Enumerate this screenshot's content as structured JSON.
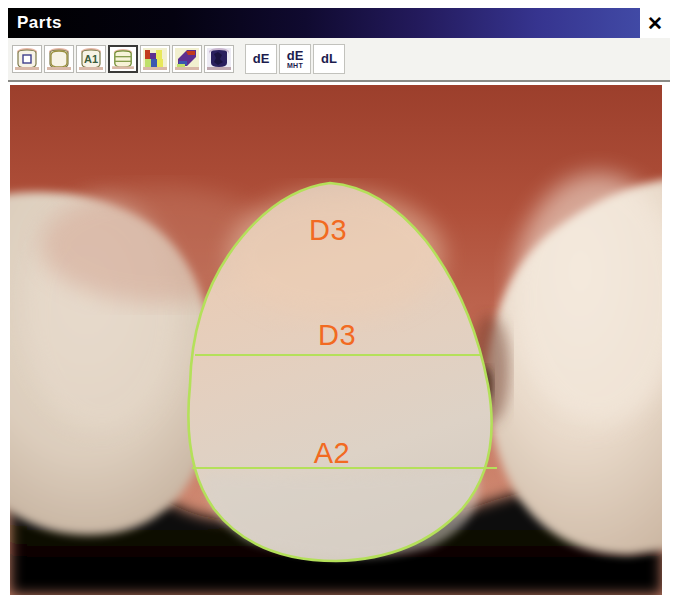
{
  "window": {
    "title": "Parts",
    "close_label": "✕",
    "title_gradient_from": "#000000",
    "title_gradient_to": "#4450ac"
  },
  "toolbar": {
    "icon_buttons": [
      {
        "name": "tooth-region-select-icon",
        "tooltip": "Tooth region",
        "pressed": false
      },
      {
        "name": "tooth-outline-icon",
        "tooltip": "Tooth outline",
        "pressed": false
      },
      {
        "name": "tooth-shade-a1-icon",
        "tooltip": "Shade A1",
        "label": "A1",
        "pressed": false
      },
      {
        "name": "tooth-parts-icon",
        "tooltip": "Parts",
        "pressed": true
      },
      {
        "name": "color-blocks-icon",
        "tooltip": "Color map",
        "pressed": false
      },
      {
        "name": "color-gradient-icon",
        "tooltip": "Gradient map",
        "pressed": false
      },
      {
        "name": "color-contrast-icon",
        "tooltip": "Contrast map",
        "pressed": false
      }
    ],
    "text_buttons": [
      {
        "name": "de-button",
        "line1": "dE",
        "line2": ""
      },
      {
        "name": "de-mht-button",
        "line1": "dE",
        "line2": "MHT"
      },
      {
        "name": "dl-button",
        "line1": "dL",
        "line2": ""
      }
    ]
  },
  "photo": {
    "alt": "intraoral photograph of three anterior teeth with central incisor outlined in green and divided into three shade zones",
    "outline_color": "#b4e05a",
    "label_color": "#f26a21",
    "gum_color": "#b5503a",
    "tooth_color": "#e7d3c3",
    "background_color": "#000000",
    "shade_zones": [
      {
        "name": "incisal-zone",
        "label": "D3",
        "x": 318,
        "y": 145
      },
      {
        "name": "middle-zone",
        "label": "D3",
        "x": 327,
        "y": 248
      },
      {
        "name": "cervical-zone",
        "label": "A2",
        "x": 322,
        "y": 365
      }
    ]
  }
}
